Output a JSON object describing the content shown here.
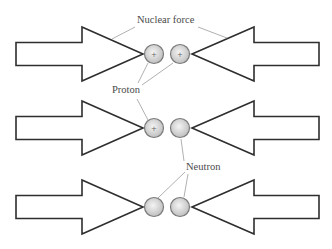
{
  "labels": {
    "nuclear_force": "Nuclear force",
    "proton": "Proton",
    "neutron": "Neutron"
  },
  "rows": [
    {
      "name": "proton-proton",
      "particles": [
        {
          "type": "proton",
          "symbol": "+"
        },
        {
          "type": "proton",
          "symbol": "+"
        }
      ]
    },
    {
      "name": "proton-neutron",
      "particles": [
        {
          "type": "proton",
          "symbol": "+"
        },
        {
          "type": "neutron",
          "symbol": ""
        }
      ]
    },
    {
      "name": "neutron-neutron",
      "particles": [
        {
          "type": "neutron",
          "symbol": ""
        },
        {
          "type": "neutron",
          "symbol": ""
        }
      ]
    }
  ],
  "colors": {
    "arrow_stroke": "#2e2e2e",
    "arrow_fill": "#ffffff",
    "particle_center": "#f4f4f4",
    "particle_edge": "#bdbdbd",
    "particle_stroke": "#7a7a7a",
    "leader_line": "#9c9c9c"
  }
}
